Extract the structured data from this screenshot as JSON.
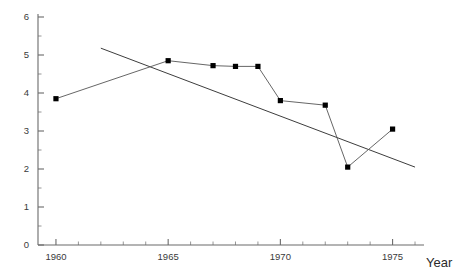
{
  "chart_data": {
    "type": "line",
    "title": "",
    "subtitle": "",
    "xlabel": "Year",
    "ylabel": "",
    "xlim": [
      1959.2,
      1976.4
    ],
    "ylim": [
      0,
      6
    ],
    "grid": false,
    "legend": null,
    "x_ticks_major": [
      1960,
      1965,
      1970,
      1975
    ],
    "x_tick_labels": [
      "1960",
      "1965",
      "1970",
      "1975"
    ],
    "x_ticks_minor": [
      1961,
      1962,
      1963,
      1964,
      1966,
      1967,
      1968,
      1969,
      1971,
      1972,
      1973,
      1974,
      1976
    ],
    "y_ticks_major": [
      0,
      1,
      2,
      3,
      4,
      5,
      6
    ],
    "y_tick_labels": [
      "0",
      "1",
      "2",
      "3",
      "4",
      "5",
      "6"
    ],
    "y_ticks_minor": [
      0.5,
      1.5,
      2.5,
      3.5,
      4.5,
      5.5
    ],
    "series": [
      {
        "name": "observed",
        "marker": "square",
        "marker_color": "#000000",
        "line_color": "#555555",
        "x": [
          1960,
          1965,
          1967,
          1968,
          1969,
          1970,
          1972,
          1973,
          1975
        ],
        "values": [
          3.85,
          4.85,
          4.72,
          4.7,
          4.7,
          3.8,
          3.68,
          2.05,
          3.05
        ]
      },
      {
        "name": "trend",
        "marker": "none",
        "line_color": "#3d3d3d",
        "x": [
          1962,
          1976
        ],
        "values": [
          5.18,
          2.05
        ]
      }
    ]
  },
  "axis": {
    "x_title": "Year"
  }
}
